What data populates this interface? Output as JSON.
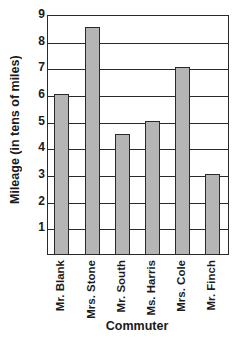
{
  "chart_data": {
    "type": "bar",
    "title": "",
    "xlabel": "Commuter",
    "ylabel": "Mileage (in tens of miles)",
    "categories": [
      "Mr. Blank",
      "Mrs. Stone",
      "Mr. South",
      "Ms. Harris",
      "Mrs. Cole",
      "Mr. Finch"
    ],
    "values": [
      6,
      8.5,
      4.5,
      5,
      7,
      3
    ],
    "ylim": [
      0,
      9
    ],
    "yticks": [
      "1",
      "2",
      "3",
      "4",
      "5",
      "6",
      "7",
      "8",
      "9"
    ],
    "grid": true,
    "bar_color": "#b5b5b5",
    "outline_color": "#2a2a2a"
  }
}
